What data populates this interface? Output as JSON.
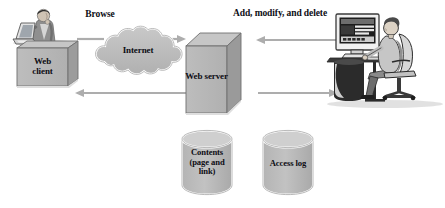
{
  "diagram": {
    "flow_labels": [
      {
        "id": "browse",
        "text": "Browse"
      },
      {
        "id": "admin",
        "text": "Add, modify, and delete"
      }
    ],
    "nodes": [
      {
        "id": "web-client",
        "text": "Web\nclient",
        "shape": "3d-box"
      },
      {
        "id": "internet",
        "text": "Internet",
        "shape": "cloud"
      },
      {
        "id": "web-server",
        "text": "Web server",
        "shape": "3d-box"
      }
    ],
    "data_stores": [
      {
        "id": "contents",
        "text": "Contents\n(page and\nlink)",
        "shape": "cylinder"
      },
      {
        "id": "access-log",
        "text": "Access log",
        "shape": "cylinder"
      }
    ],
    "actors": [
      {
        "id": "end-user",
        "description": "person using laptop"
      },
      {
        "id": "administrator",
        "description": "person at desktop computer"
      }
    ],
    "arrows": [
      {
        "id": "client-to-internet",
        "direction": "right"
      },
      {
        "id": "internet-to-server",
        "direction": "right"
      },
      {
        "id": "server-to-client",
        "direction": "left"
      },
      {
        "id": "admin-to-server",
        "direction": "left"
      },
      {
        "id": "server-to-admin",
        "direction": "right"
      }
    ],
    "colors": {
      "fill_gray": "#b8b8b8",
      "fill_light": "#cfcfcf",
      "fill_dark": "#9a9a9a",
      "outline": "#6f6f6f",
      "arrow": "#adadad",
      "text": "#0d0d14",
      "background": "#ffffff"
    }
  }
}
